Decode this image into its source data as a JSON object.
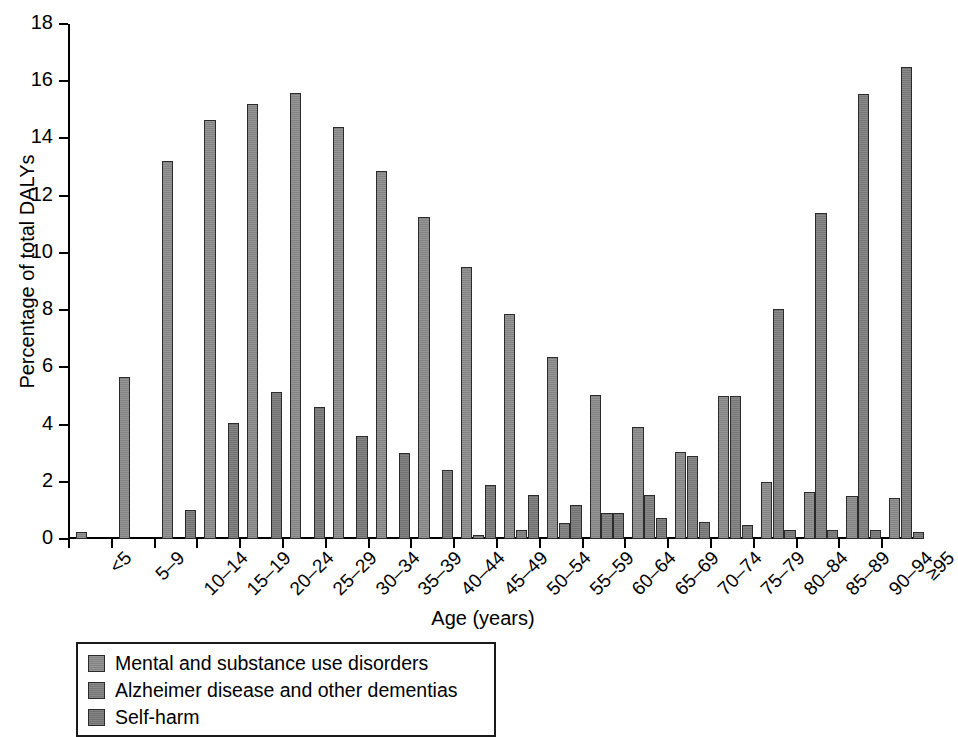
{
  "chart_data": {
    "type": "bar",
    "title": "",
    "xlabel": "Age (years)",
    "ylabel": "Percentage of total DALYs",
    "ylim": [
      0,
      18
    ],
    "yticks": [
      0,
      2,
      4,
      6,
      8,
      10,
      12,
      14,
      16,
      18
    ],
    "grid": false,
    "legend_position": "below-left",
    "categories": [
      "<5",
      "5–9",
      "10–14",
      "15–19",
      "20–24",
      "25–29",
      "30–34",
      "35–39",
      "40–44",
      "45–49",
      "50–54",
      "55–59",
      "60–64",
      "65–69",
      "70–74",
      "75–79",
      "80–84",
      "85–89",
      "90–94",
      "≥95"
    ],
    "series": [
      {
        "name": "Mental and substance use disorders",
        "color": "#8a8a8a",
        "values": [
          0.25,
          5.65,
          13.2,
          14.65,
          15.2,
          15.6,
          14.4,
          12.85,
          11.25,
          9.5,
          7.85,
          6.35,
          5.05,
          3.9,
          3.05,
          5.0,
          2.0,
          1.65,
          1.5,
          1.45
        ]
      },
      {
        "name": "Alzheimer disease and other dementias",
        "color": "#7d7d7d",
        "values": [
          0,
          0,
          0,
          0,
          0,
          0,
          0,
          0,
          0,
          0.15,
          0.3,
          0.55,
          0.9,
          1.55,
          2.9,
          5.0,
          8.05,
          11.4,
          15.55,
          16.5
        ]
      },
      {
        "name": "Self-harm",
        "color": "#777777",
        "values": [
          0,
          0,
          1.0,
          4.05,
          5.15,
          4.6,
          3.6,
          3.0,
          2.4,
          1.9,
          1.55,
          1.2,
          0.9,
          0.75,
          0.6,
          0.5,
          0.3,
          0.3,
          0.3,
          0.25
        ]
      }
    ]
  },
  "legend": {
    "items": [
      {
        "label": "Mental and substance use disorders"
      },
      {
        "label": "Alzheimer disease and other dementias"
      },
      {
        "label": "Self-harm"
      }
    ]
  }
}
